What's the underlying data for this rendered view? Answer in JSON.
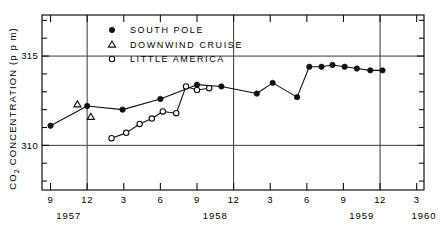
{
  "chart_data": {
    "type": "line",
    "title": "",
    "subtitle": "",
    "xlabel": "",
    "ylabel": "CO2 CONCENTRATION (p p m)",
    "ylabel_main": "CO",
    "ylabel_sub": "2",
    "ylabel_rest": " CONCENTRATION (p p m)",
    "ylim": [
      307.5,
      317.3
    ],
    "xlim": [
      8.3,
      39.6
    ],
    "grid": "horizontal-at-major-yticks",
    "legend_position": "inside-top-left",
    "y_major_ticks": [
      310,
      315
    ],
    "y_major_tick_labels": [
      "310",
      "315"
    ],
    "y_minor_ticks": [
      308,
      309,
      311,
      312,
      313,
      314,
      316,
      317
    ],
    "x_tick_labels": [
      "9",
      "12",
      "3",
      "6",
      "9",
      "12",
      "3",
      "6",
      "9",
      "12",
      "3"
    ],
    "x_tick_months": [
      9,
      12,
      15,
      18,
      21,
      24,
      27,
      30,
      33,
      36,
      39
    ],
    "x_year_labels": [
      "1957",
      "1958",
      "1959",
      "1960"
    ],
    "x_year_positions": [
      10.5,
      22.5,
      34.5,
      39.6
    ],
    "x_year_dividers": [
      12,
      24,
      36
    ],
    "legend": [
      {
        "name": "SOUTH POLE",
        "marker": "filled-circle"
      },
      {
        "name": "DOWNWIND CRUISE",
        "marker": "open-triangle"
      },
      {
        "name": "LITTLE AMERICA",
        "marker": "open-circle"
      }
    ],
    "series": [
      {
        "name": "SOUTH POLE",
        "marker": "filled-circle",
        "x": [
          9.0,
          12.0,
          14.9,
          18.0,
          21.0,
          23.0,
          25.9,
          27.2,
          29.2,
          30.2,
          31.2,
          32.1,
          33.1,
          34.1,
          35.2,
          36.2
        ],
        "values": [
          311.1,
          312.2,
          312.0,
          312.6,
          313.4,
          313.3,
          312.9,
          313.5,
          312.7,
          314.4,
          314.4,
          314.5,
          314.4,
          314.3,
          314.2,
          314.2
        ]
      },
      {
        "name": "DOWNWIND CRUISE",
        "marker": "open-triangle",
        "x": [
          11.2,
          12.3
        ],
        "values": [
          312.3,
          311.6
        ]
      },
      {
        "name": "LITTLE AMERICA",
        "marker": "open-circle",
        "x": [
          14.0,
          15.2,
          16.3,
          17.3,
          18.2,
          19.3,
          20.1,
          21.0,
          22.0
        ],
        "values": [
          310.4,
          310.7,
          311.2,
          311.5,
          311.9,
          311.8,
          313.3,
          313.1,
          313.2
        ]
      }
    ]
  }
}
